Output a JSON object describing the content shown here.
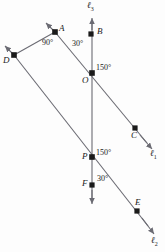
{
  "figure": {
    "type": "geometry-diagram",
    "width": 165,
    "height": 252,
    "background": "#fdfdfd",
    "stroke_color": "#6b6b73",
    "point_color": "#1a1a1a",
    "text_color": "#1a1a1a"
  },
  "points": [
    {
      "id": "A",
      "label": "A",
      "x": 55,
      "y": 32,
      "label_x": 59,
      "label_y": 26
    },
    {
      "id": "B",
      "label": "B",
      "x": 91,
      "y": 34,
      "label_x": 96,
      "label_y": 29
    },
    {
      "id": "C",
      "label": "C",
      "x": 135,
      "y": 128,
      "label_x": 133,
      "label_y": 132
    },
    {
      "id": "D",
      "label": "D",
      "x": 14,
      "y": 55,
      "label_x": 5,
      "label_y": 58
    },
    {
      "id": "E",
      "label": "E",
      "x": 137,
      "y": 211,
      "label_x": 136,
      "label_y": 200
    },
    {
      "id": "F",
      "label": "F",
      "x": 92,
      "y": 185,
      "label_x": 83,
      "label_y": 181
    },
    {
      "id": "O",
      "label": "O",
      "x": 92,
      "y": 73,
      "label_x": 83,
      "label_y": 78
    },
    {
      "id": "P",
      "label": "P",
      "x": 92,
      "y": 157,
      "label_x": 83,
      "label_y": 155
    }
  ],
  "lines": [
    {
      "id": "l1",
      "label": "ℓ",
      "subscript": "1",
      "label_x": 152,
      "label_y": 152
    },
    {
      "id": "l2",
      "label": "ℓ",
      "subscript": "2",
      "label_x": 152,
      "label_y": 239
    },
    {
      "id": "l3",
      "label": "ℓ",
      "subscript": "3",
      "label_x": 88,
      "label_y": 3
    }
  ],
  "angles": [
    {
      "id": "angle-A",
      "value": "90°",
      "x": 44,
      "y": 40,
      "at": "A"
    },
    {
      "id": "angle-O-upper",
      "value": "30°",
      "x": 74,
      "y": 41,
      "at": "O"
    },
    {
      "id": "angle-O-right",
      "value": "150°",
      "x": 96,
      "y": 65,
      "at": "O"
    },
    {
      "id": "angle-P-right",
      "value": "150°",
      "x": 96,
      "y": 150,
      "at": "P"
    },
    {
      "id": "angle-P-lower",
      "value": "30°",
      "x": 98,
      "y": 176,
      "at": "P"
    }
  ]
}
